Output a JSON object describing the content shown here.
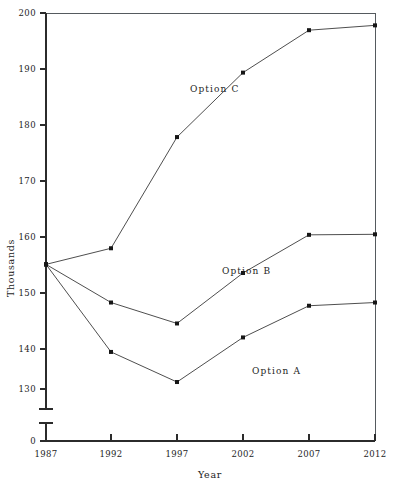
{
  "chart_data": {
    "type": "line",
    "title": "",
    "xlabel": "Year",
    "ylabel": "Thousands",
    "categories": [
      1987,
      1992,
      1997,
      2002,
      2007,
      2012
    ],
    "xtick_labels": [
      "1987",
      "1992",
      "1997",
      "2002",
      "2007",
      "2012"
    ],
    "ytick_labels": [
      "0",
      "130",
      "140",
      "150",
      "160",
      "170",
      "180",
      "190",
      "200"
    ],
    "ylim": [
      130,
      200
    ],
    "xlim": [
      1987,
      2012
    ],
    "grid": false,
    "legend_position": "inline-annotations",
    "axis_break": true,
    "axis_break_note": "y-axis broken between 0 and 130",
    "series": [
      {
        "name": "Option A",
        "label": "Option A",
        "values": [
          153.2,
          136.9,
          131.3,
          139.6,
          145.5,
          146.1
        ]
      },
      {
        "name": "Option B",
        "label": "Option B",
        "values": [
          153.2,
          146.1,
          142.2,
          151.6,
          158.7,
          158.8
        ]
      },
      {
        "name": "Option C",
        "label": "Option C",
        "values": [
          153.2,
          156.2,
          176.9,
          188.9,
          196.8,
          197.7
        ]
      }
    ],
    "annotations": [
      {
        "text": "Option C",
        "x": 190,
        "y": 92
      },
      {
        "text": "Option B",
        "x": 222,
        "y": 274
      },
      {
        "text": "Option A",
        "x": 252,
        "y": 374
      }
    ],
    "colors": {
      "line": "#3a3a3a",
      "marker": "#161616",
      "axis": "#2b2b2b",
      "frame": "#555a5e",
      "background": "#ffffff",
      "text": "#1d1d1d"
    }
  }
}
